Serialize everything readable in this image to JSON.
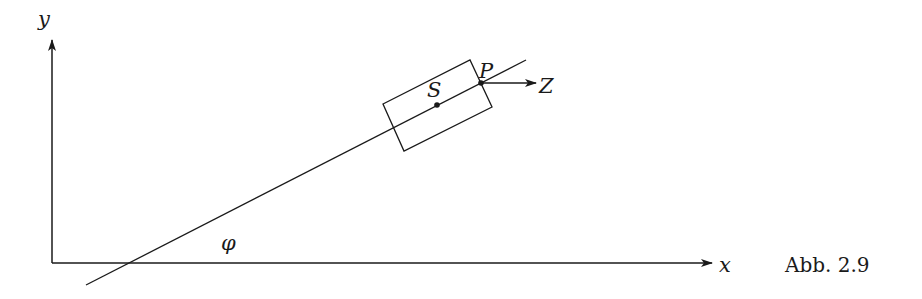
{
  "figure": {
    "caption": "Abb. 2.9",
    "axes": {
      "x_label": "x",
      "y_label": "y"
    },
    "labels": {
      "center_point": "S",
      "contact_point": "P",
      "force": "Z",
      "angle": "φ"
    },
    "colors": {
      "stroke": "#1a1a1a",
      "background": "#ffffff"
    }
  }
}
